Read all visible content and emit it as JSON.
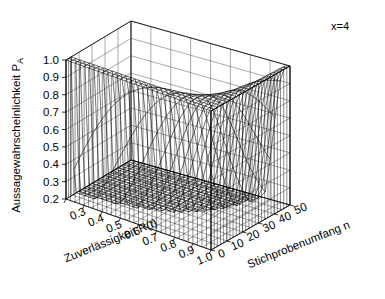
{
  "figure": {
    "background": "#ffffff",
    "line_color": "#000000",
    "annotation": "x=4"
  },
  "chart_data": {
    "type": "surface",
    "title": "",
    "subtitle": "",
    "annotations": [
      {
        "text": "x=4",
        "position": "top-right"
      }
    ],
    "xlabel": "Zuverlässigkeit R(t)",
    "ylabel": "Stichprobenumfang n",
    "zlabel": "Aussagewahrscheinlichkeit P",
    "zlabel_subscript": "A",
    "xticks": [
      0.2,
      0.3,
      0.4,
      0.5,
      0.6,
      0.7,
      0.8,
      0.9,
      1.0
    ],
    "xtick_labels": [
      "0.2",
      "0.3",
      "0.4",
      "0.5",
      "0.6",
      "0.7",
      "0.8",
      "0.9",
      "1.0"
    ],
    "yticks": [
      0,
      10,
      20,
      30,
      40,
      50
    ],
    "ytick_labels": [
      "0",
      "10",
      "20",
      "30",
      "40",
      "50"
    ],
    "zticks": [
      0.2,
      0.3,
      0.4,
      0.5,
      0.6,
      0.7,
      0.8,
      0.9,
      1.0
    ],
    "ztick_labels": [
      "0.2",
      "0.3",
      "0.4",
      "0.5",
      "0.6",
      "0.7",
      "0.8",
      "0.9",
      "1.0"
    ],
    "xlim": [
      0.2,
      1.0
    ],
    "ylim": [
      0,
      50
    ],
    "zlim": [
      0.2,
      1.0
    ],
    "grid": true,
    "mesh": {
      "nx": 33,
      "ny": 26,
      "color": "#000000"
    },
    "surface_model": {
      "description": "Acceptance probability P_A = sum_{i=0..x} C(n,i) (1-R)^i R^(n-i), accepted number x=4",
      "x_accept": 4
    },
    "sample_points": [
      {
        "R": 0.2,
        "n": 0,
        "PA": 1.0
      },
      {
        "R": 0.2,
        "n": 10,
        "PA": 0.967
      },
      {
        "R": 0.2,
        "n": 20,
        "PA": 0.63
      },
      {
        "R": 0.2,
        "n": 30,
        "PA": 0.255
      },
      {
        "R": 0.2,
        "n": 40,
        "PA": 0.076
      },
      {
        "R": 0.2,
        "n": 50,
        "PA": 0.018
      },
      {
        "R": 0.5,
        "n": 0,
        "PA": 1.0
      },
      {
        "R": 0.5,
        "n": 10,
        "PA": 0.377
      },
      {
        "R": 0.5,
        "n": 20,
        "PA": 0.006
      },
      {
        "R": 0.5,
        "n": 30,
        "PA": 0.0
      },
      {
        "R": 0.5,
        "n": 40,
        "PA": 0.0
      },
      {
        "R": 0.5,
        "n": 50,
        "PA": 0.0
      },
      {
        "R": 0.8,
        "n": 0,
        "PA": 1.0
      },
      {
        "R": 0.8,
        "n": 10,
        "PA": 0.967
      },
      {
        "R": 0.8,
        "n": 20,
        "PA": 0.63
      },
      {
        "R": 0.8,
        "n": 30,
        "PA": 0.255
      },
      {
        "R": 0.8,
        "n": 40,
        "PA": 0.076
      },
      {
        "R": 0.8,
        "n": 50,
        "PA": 0.018
      },
      {
        "R": 0.9,
        "n": 0,
        "PA": 1.0
      },
      {
        "R": 0.9,
        "n": 20,
        "PA": 0.957
      },
      {
        "R": 0.9,
        "n": 50,
        "PA": 0.431
      },
      {
        "R": 1.0,
        "n": 0,
        "PA": 1.0
      },
      {
        "R": 1.0,
        "n": 25,
        "PA": 1.0
      },
      {
        "R": 1.0,
        "n": 50,
        "PA": 1.0
      }
    ]
  },
  "axes": {
    "x": {
      "label": "Zuverlässigkeit R(t)",
      "ticks": [
        "0.2",
        "0.3",
        "0.4",
        "0.5",
        "0.6",
        "0.7",
        "0.8",
        "0.9",
        "1.0"
      ]
    },
    "y": {
      "label": "Stichprobenumfang n",
      "ticks": [
        "0",
        "10",
        "20",
        "30",
        "40",
        "50"
      ]
    },
    "z": {
      "label": "Aussagewahrscheinlichkeit P",
      "label_sub": "A",
      "ticks": [
        "0.2",
        "0.3",
        "0.4",
        "0.5",
        "0.6",
        "0.7",
        "0.8",
        "0.9",
        "1.0"
      ]
    }
  }
}
